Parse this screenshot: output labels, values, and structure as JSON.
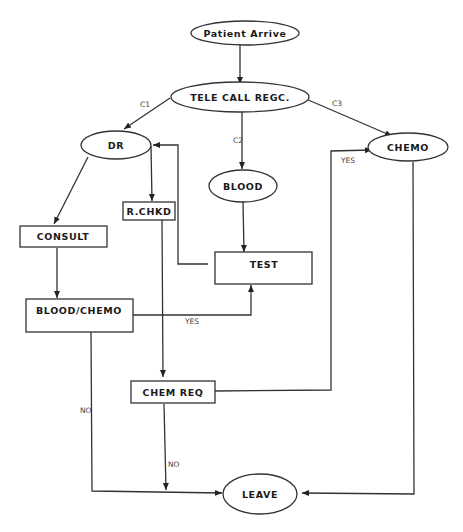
{
  "diagram": {
    "nodes": {
      "patient_arrive": "Patient Arrive",
      "tele_call": "TELE CALL REGC.",
      "dr": "DR",
      "blood": "BLOOD",
      "chemo": "CHEMO",
      "rchkd": "R.CHKD",
      "consult": "CONSULT",
      "test": "TEST",
      "blood_chemo": "BLOOD/CHEMO",
      "chem_req": "CHEM REQ",
      "leave": "LEAVE"
    },
    "edge_labels": {
      "c1": "C1",
      "c2": "C2",
      "c3": "C3",
      "yes_chemo": "YES",
      "yes_test": "YES",
      "no_left": "NO",
      "no_chemreq": "NO"
    },
    "edges": [
      {
        "from": "Patient Arrive",
        "to": "TELE CALL REGC."
      },
      {
        "from": "TELE CALL REGC.",
        "to": "DR",
        "label": "C1"
      },
      {
        "from": "TELE CALL REGC.",
        "to": "BLOOD",
        "label": "C2"
      },
      {
        "from": "TELE CALL REGC.",
        "to": "CHEMO",
        "label": "C3"
      },
      {
        "from": "DR",
        "to": "CONSULT"
      },
      {
        "from": "DR",
        "to": "R.CHKD"
      },
      {
        "from": "TEST",
        "to": "DR"
      },
      {
        "from": "BLOOD",
        "to": "TEST"
      },
      {
        "from": "CONSULT",
        "to": "BLOOD/CHEMO"
      },
      {
        "from": "BLOOD/CHEMO",
        "to": "TEST",
        "label": "YES"
      },
      {
        "from": "BLOOD/CHEMO",
        "to": "LEAVE",
        "label": "NO"
      },
      {
        "from": "R.CHKD",
        "to": "CHEM REQ"
      },
      {
        "from": "CHEM REQ",
        "to": "CHEMO",
        "label": "YES"
      },
      {
        "from": "CHEM REQ",
        "to": "LEAVE",
        "label": "NO"
      },
      {
        "from": "CHEMO",
        "to": "LEAVE"
      }
    ]
  }
}
